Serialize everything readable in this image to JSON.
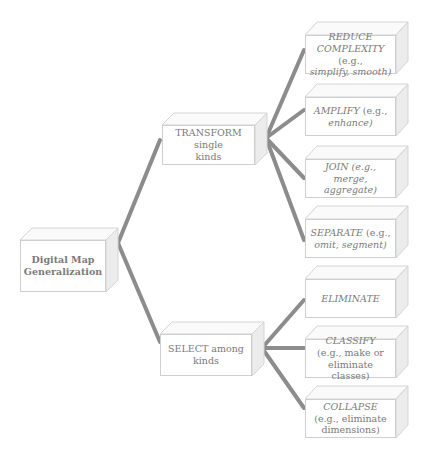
{
  "diagram": {
    "root": {
      "label_line1": "Digital Map",
      "label_line2": "Generalization"
    },
    "branches": [
      {
        "label_line1": "TRANSFORM single",
        "label_line2": "kinds",
        "children": [
          {
            "keyword": "REDUCE",
            "keyword2": "COMPLEXITY",
            "detail": "(e.g.,",
            "detail2": "simplify, smooth)"
          },
          {
            "keyword": "AMPLIFY",
            "detail": "(e.g.,",
            "detail2": "enhance)"
          },
          {
            "keyword": "JOIN",
            "detail": "(e.g., merge,",
            "detail2": "aggregate)"
          },
          {
            "keyword": "SEPARATE",
            "detail": "(e.g.,",
            "detail2": "omit, segment)"
          }
        ]
      },
      {
        "label_line1": "SELECT among",
        "label_line2": "kinds",
        "children": [
          {
            "keyword": "ELIMINATE"
          },
          {
            "keyword": "CLASSIFY",
            "detail": "(e.g., make or",
            "detail2": "eliminate classes)"
          },
          {
            "keyword": "COLLAPSE",
            "detail": "(e.g., eliminate",
            "detail2": "dimensions)"
          }
        ]
      }
    ]
  },
  "colors": {
    "connector": "#8c8c8c",
    "box_border": "#cfcfcf",
    "box_side": "#ececec",
    "text": "#7a7a7a"
  }
}
